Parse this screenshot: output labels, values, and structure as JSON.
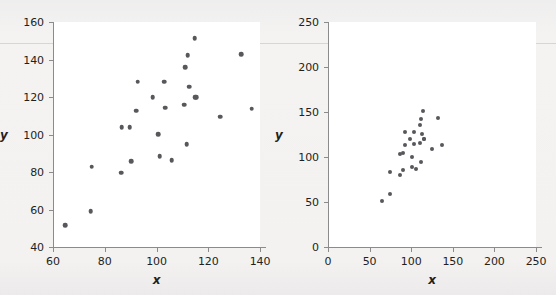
{
  "figure": {
    "background_color": "#f2f2f1",
    "plot_background_color": "#ffffff",
    "axis_color": "#8b8b8d",
    "marker_color": "#58575b"
  },
  "chart_data": [
    {
      "type": "scatter",
      "panel": "left",
      "title": "",
      "xlabel": "x",
      "ylabel": "y",
      "xlim": [
        60,
        140
      ],
      "ylim": [
        40,
        160
      ],
      "xticks": [
        60,
        80,
        100,
        120,
        140
      ],
      "yticks": [
        40,
        60,
        80,
        100,
        120,
        140,
        160
      ],
      "xtick_labels": [
        "60",
        "80",
        "100",
        "120",
        "140"
      ],
      "ytick_labels": [
        "40",
        "60",
        "80",
        "100",
        "120",
        "140",
        "160"
      ],
      "grid": false,
      "legend": null,
      "x": [
        64.8,
        74.6,
        75.0,
        86.3,
        86.6,
        89.6,
        90.2,
        92.2,
        92.8,
        98.6,
        100.6,
        101.2,
        103.0,
        103.4,
        105.8,
        110.8,
        111.0,
        111.6,
        112.0,
        112.6,
        114.7,
        114.9,
        115.4,
        124.6,
        132.8,
        136.8
      ],
      "y": [
        51.5,
        59.0,
        82.8,
        79.6,
        103.8,
        104.0,
        85.8,
        112.8,
        128.2,
        119.8,
        100.2,
        88.4,
        128.2,
        114.2,
        86.4,
        116.0,
        135.8,
        94.8,
        142.2,
        125.4,
        151.5,
        119.8,
        119.8,
        109.4,
        142.8,
        113.8
      ]
    },
    {
      "type": "scatter",
      "panel": "right",
      "title": "",
      "xlabel": "x",
      "ylabel": "y",
      "xlim": [
        0,
        250
      ],
      "ylim": [
        0,
        250
      ],
      "xticks": [
        0,
        50,
        100,
        150,
        200,
        250
      ],
      "yticks": [
        0,
        50,
        100,
        150,
        200,
        250
      ],
      "xtick_labels": [
        "0",
        "50",
        "100",
        "150",
        "200",
        "250"
      ],
      "ytick_labels": [
        "0",
        "50",
        "100",
        "150",
        "200",
        "250"
      ],
      "grid": false,
      "legend": null,
      "x": [
        64.8,
        74.6,
        75.0,
        86.3,
        86.6,
        89.6,
        90.2,
        92.2,
        92.8,
        98.6,
        100.6,
        101.2,
        103.0,
        103.4,
        105.8,
        110.8,
        111.0,
        111.6,
        112.0,
        112.6,
        114.7,
        114.9,
        115.4,
        124.6,
        132.8,
        136.8
      ],
      "y": [
        51.5,
        59.0,
        82.8,
        79.6,
        103.8,
        104.0,
        85.8,
        112.8,
        128.2,
        119.8,
        100.2,
        88.4,
        128.2,
        114.2,
        86.4,
        116.0,
        135.8,
        94.8,
        142.2,
        125.4,
        151.5,
        119.8,
        119.8,
        109.4,
        142.8,
        113.8
      ]
    }
  ]
}
